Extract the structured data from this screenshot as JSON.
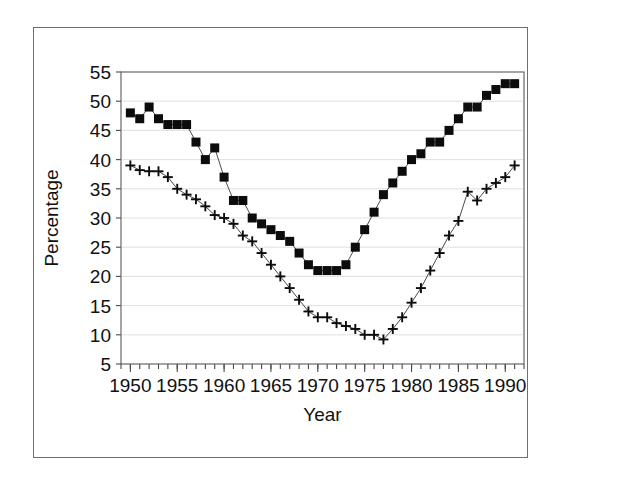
{
  "figure": {
    "has_outer_frame": true,
    "background_color": "#ffffff",
    "line_color": "#4b4b4b",
    "marker_color": "#0c0c0c",
    "grid_color": "#d8d8d8",
    "axis_color": "#5a5a5a"
  },
  "chart_data": {
    "type": "line",
    "title": "",
    "subtitle": "",
    "xlabel": "Year",
    "ylabel": "Percentage",
    "xlim": [
      1949.0,
      1992.0
    ],
    "ylim": [
      5,
      55
    ],
    "yticks": [
      5,
      10,
      15,
      20,
      25,
      30,
      35,
      40,
      45,
      50,
      55
    ],
    "ytick_labels": [
      "5",
      "10",
      "15",
      "20",
      "25",
      "30",
      "35",
      "40",
      "45",
      "50",
      "55"
    ],
    "xticks": [
      1950,
      1955,
      1960,
      1965,
      1970,
      1975,
      1980,
      1985,
      1990
    ],
    "xtick_labels": [
      "1950",
      "1955",
      "1960",
      "1965",
      "1970",
      "1975",
      "1980",
      "1985",
      "1990"
    ],
    "x_minor_tick_interval": 1,
    "grid": "horizontal",
    "legend": "none",
    "x": [
      1950,
      1951,
      1952,
      1953,
      1954,
      1955,
      1956,
      1957,
      1958,
      1959,
      1960,
      1961,
      1962,
      1963,
      1964,
      1965,
      1966,
      1967,
      1968,
      1969,
      1970,
      1971,
      1972,
      1973,
      1974,
      1975,
      1976,
      1977,
      1978,
      1979,
      1980,
      1981,
      1982,
      1983,
      1984,
      1985,
      1986,
      1987,
      1988,
      1989,
      1990,
      1991
    ],
    "series": [
      {
        "name": "series-squares",
        "marker": "square",
        "values": [
          48,
          47,
          49,
          47,
          46,
          46,
          46,
          43,
          40,
          42,
          37,
          33,
          33,
          30,
          29,
          28,
          27,
          26,
          24,
          22,
          21,
          21,
          21,
          22,
          25,
          28,
          31,
          34,
          36,
          38,
          40,
          41,
          43,
          43,
          45,
          47,
          49,
          49,
          51,
          52,
          53,
          53
        ],
        "marker_size_px": 9
      },
      {
        "name": "series-plus",
        "marker": "plus",
        "values": [
          39,
          38.2,
          38,
          38,
          37,
          35,
          34,
          33.2,
          32,
          30.5,
          30,
          29,
          27,
          26,
          24,
          22,
          20,
          18,
          16,
          14,
          13,
          13,
          12,
          11.5,
          11,
          10,
          10,
          9.2,
          11,
          13,
          15.5,
          18,
          21,
          24,
          27,
          29.5,
          34.5,
          33,
          35,
          36,
          37,
          39
        ],
        "marker_size_px": 9
      }
    ]
  },
  "plot_box": {
    "left_px": 121,
    "top_px": 72,
    "right_px": 524,
    "bottom_px": 364
  }
}
